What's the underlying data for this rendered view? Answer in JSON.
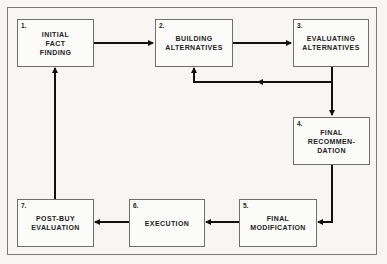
{
  "diagram": {
    "type": "flowchart",
    "steps": [
      {
        "number": "1.",
        "label": "INITIAL\nFACT\nFINDING"
      },
      {
        "number": "2.",
        "label": "BUILDING\nALTERNATIVES"
      },
      {
        "number": "3.",
        "label": "EVALUATING\nALTERNATIVES"
      },
      {
        "number": "4.",
        "label": "FINAL\nRECOMMEN-\nDATION"
      },
      {
        "number": "5.",
        "label": "FINAL\nMODIFICATION"
      },
      {
        "number": "6.",
        "label": "EXECUTION"
      },
      {
        "number": "7.",
        "label": "POST-BUY\nEVALUATION"
      }
    ],
    "connections": [
      {
        "from": "1",
        "to": "2"
      },
      {
        "from": "2",
        "to": "3"
      },
      {
        "from": "3",
        "to": "2",
        "note": "feedback loop"
      },
      {
        "from": "3",
        "to": "4"
      },
      {
        "from": "4",
        "to": "5"
      },
      {
        "from": "5",
        "to": "6"
      },
      {
        "from": "6",
        "to": "7"
      },
      {
        "from": "7",
        "to": "1"
      }
    ],
    "colors": {
      "line": "#111111",
      "box_border": "#6e6e6e",
      "background": "#f7f6f3"
    }
  }
}
